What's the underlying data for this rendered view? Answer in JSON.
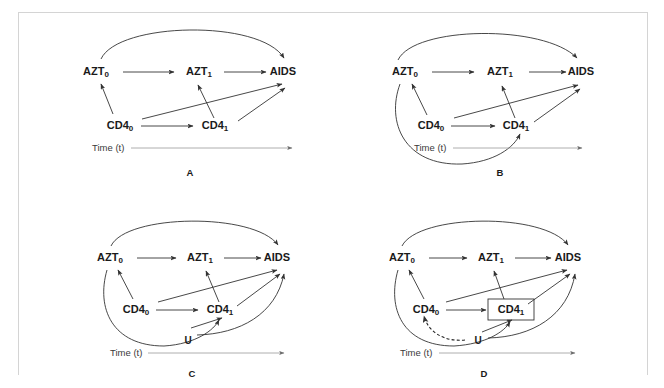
{
  "figure": {
    "type": "causal-dag-grid",
    "background_color": "#ffffff",
    "frame_color": "#d4d4d4",
    "edge_color": "#333333",
    "axis_color": "#9a9a9a",
    "text_color": "#1a1a1a",
    "panel_count": 4
  },
  "common": {
    "time_axis_label": "Time (t)",
    "node_names": {
      "azt0_base": "AZT",
      "azt0_sub": "0",
      "azt1_base": "AZT",
      "azt1_sub": "1",
      "aids": "AIDS",
      "cd40_base": "CD4",
      "cd40_sub": "0",
      "cd41_base": "CD4",
      "cd41_sub": "1",
      "u": "U"
    }
  },
  "panels": [
    {
      "id": "A",
      "caption": "A",
      "nodes": [
        "AZT0",
        "AZT1",
        "AIDS",
        "CD40",
        "CD41"
      ],
      "edges": [
        {
          "from": "AZT0",
          "to": "AZT1",
          "style": "solid"
        },
        {
          "from": "AZT1",
          "to": "AIDS",
          "style": "solid"
        },
        {
          "from": "AZT0",
          "to": "AIDS",
          "style": "solid-curved"
        },
        {
          "from": "CD40",
          "to": "AZT0",
          "style": "solid"
        },
        {
          "from": "CD40",
          "to": "CD41",
          "style": "solid"
        },
        {
          "from": "CD40",
          "to": "AIDS",
          "style": "solid"
        },
        {
          "from": "CD41",
          "to": "AZT1",
          "style": "solid"
        },
        {
          "from": "CD41",
          "to": "AIDS",
          "style": "solid"
        }
      ]
    },
    {
      "id": "B",
      "caption": "B",
      "nodes": [
        "AZT0",
        "AZT1",
        "AIDS",
        "CD40",
        "CD41"
      ],
      "edges": [
        {
          "from": "AZT0",
          "to": "AZT1",
          "style": "solid"
        },
        {
          "from": "AZT1",
          "to": "AIDS",
          "style": "solid"
        },
        {
          "from": "AZT0",
          "to": "AIDS",
          "style": "solid-curved"
        },
        {
          "from": "CD40",
          "to": "AZT0",
          "style": "solid"
        },
        {
          "from": "CD40",
          "to": "CD41",
          "style": "solid"
        },
        {
          "from": "CD40",
          "to": "AIDS",
          "style": "solid"
        },
        {
          "from": "CD41",
          "to": "AZT1",
          "style": "solid"
        },
        {
          "from": "CD41",
          "to": "AIDS",
          "style": "solid"
        },
        {
          "from": "AZT0",
          "to": "CD41",
          "style": "solid-curved-lower"
        }
      ]
    },
    {
      "id": "C",
      "caption": "C",
      "nodes": [
        "AZT0",
        "AZT1",
        "AIDS",
        "CD40",
        "CD41",
        "U"
      ],
      "edges": [
        {
          "from": "AZT0",
          "to": "AZT1",
          "style": "solid"
        },
        {
          "from": "AZT1",
          "to": "AIDS",
          "style": "solid"
        },
        {
          "from": "AZT0",
          "to": "AIDS",
          "style": "solid-curved"
        },
        {
          "from": "CD40",
          "to": "AZT0",
          "style": "solid"
        },
        {
          "from": "CD40",
          "to": "CD41",
          "style": "solid"
        },
        {
          "from": "CD40",
          "to": "AIDS",
          "style": "solid"
        },
        {
          "from": "CD41",
          "to": "AZT1",
          "style": "solid"
        },
        {
          "from": "CD41",
          "to": "AIDS",
          "style": "solid"
        },
        {
          "from": "AZT0",
          "to": "CD41",
          "style": "solid-curved-lower"
        },
        {
          "from": "U",
          "to": "CD41",
          "style": "solid"
        },
        {
          "from": "U",
          "to": "AIDS",
          "style": "solid-curved"
        }
      ]
    },
    {
      "id": "D",
      "caption": "D",
      "nodes": [
        "AZT0",
        "AZT1",
        "AIDS",
        "CD40",
        "CD41",
        "U"
      ],
      "boxed_nodes": [
        "CD41"
      ],
      "edges": [
        {
          "from": "AZT0",
          "to": "AZT1",
          "style": "solid"
        },
        {
          "from": "AZT1",
          "to": "AIDS",
          "style": "solid"
        },
        {
          "from": "AZT0",
          "to": "AIDS",
          "style": "solid-curved"
        },
        {
          "from": "CD40",
          "to": "AZT0",
          "style": "solid"
        },
        {
          "from": "CD40",
          "to": "CD41",
          "style": "solid"
        },
        {
          "from": "CD40",
          "to": "AIDS",
          "style": "solid"
        },
        {
          "from": "CD41",
          "to": "AZT1",
          "style": "solid"
        },
        {
          "from": "CD41",
          "to": "AIDS",
          "style": "solid"
        },
        {
          "from": "AZT0",
          "to": "CD41",
          "style": "solid-curved-lower"
        },
        {
          "from": "U",
          "to": "CD41",
          "style": "solid"
        },
        {
          "from": "U",
          "to": "AIDS",
          "style": "solid-curved"
        },
        {
          "from": "U",
          "to": "CD40",
          "style": "dashed-curved"
        }
      ]
    }
  ]
}
